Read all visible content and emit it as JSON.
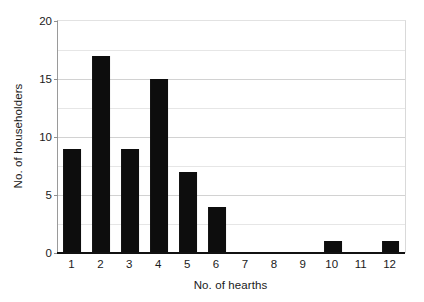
{
  "chart_data": {
    "type": "bar",
    "title": "",
    "xlabel": "No. of hearths",
    "ylabel": "No. of householders",
    "categories": [
      "1",
      "2",
      "3",
      "4",
      "5",
      "6",
      "7",
      "8",
      "9",
      "10",
      "11",
      "12"
    ],
    "values": [
      9,
      17,
      9,
      15,
      7,
      4,
      0,
      0,
      0,
      1,
      0,
      1
    ],
    "ylim": [
      0,
      20
    ],
    "y_ticks": [
      0,
      5,
      10,
      15,
      20
    ],
    "y_tick_labels": [
      "0",
      "5",
      "10",
      "15",
      "20"
    ],
    "gridlines": {
      "horizontal": true,
      "vertical": false,
      "major_interval": 5,
      "minor_interval": 2.5,
      "positions": [
        2.5,
        5,
        7.5,
        10,
        12.5,
        15,
        17.5
      ]
    },
    "legend": null,
    "legend_position": "none",
    "bar_color": "#0d0d0d",
    "grid_color": "#d2d2d2",
    "axis_color": "#111111",
    "background": "#ffffff",
    "series": [
      {
        "name": "No. of householders",
        "values": [
          9,
          17,
          9,
          15,
          7,
          4,
          0,
          0,
          0,
          1,
          0,
          1
        ]
      }
    ],
    "annotations": []
  }
}
